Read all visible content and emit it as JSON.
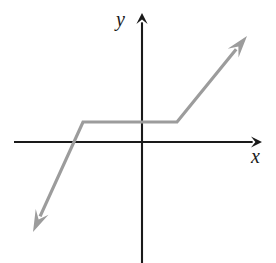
{
  "figure": {
    "type": "math-graph",
    "width": 276,
    "height": 263,
    "background_color": "#ffffff",
    "axis_color": "#1a1a1a",
    "curve_color": "#9c9c9c",
    "labels": {
      "y_axis": "y",
      "x_axis": "x"
    }
  },
  "chart_data": {
    "type": "line",
    "title": "",
    "subtitle": "",
    "xlabel": "x",
    "ylabel": "y",
    "grid": false,
    "legend": "none",
    "annotations": [],
    "axes": {
      "origin_px": [
        142,
        142
      ],
      "x_axis_px": {
        "start": [
          14,
          142
        ],
        "end": [
          262,
          142
        ],
        "arrow_end": "right"
      },
      "y_axis_px": {
        "start": [
          142,
          263
        ],
        "end": [
          142,
          13
        ],
        "arrow_end": "top"
      },
      "xlim": [
        -4.2,
        4.0
      ],
      "ylim": [
        -4.0,
        2.1
      ],
      "tick_labels_x": [],
      "tick_labels_y": []
    },
    "series": [
      {
        "name": "piecewise linear function",
        "description": "Increasing ray from lower left, flat plateau across the origin region, then increasing ray to upper right",
        "arrow_start": true,
        "arrow_end": true,
        "points_px": [
          [
            33,
            232
          ],
          [
            83,
            122
          ],
          [
            177,
            122
          ],
          [
            247,
            36
          ]
        ],
        "points_data": [
          [
            -3.6,
            -2.9
          ],
          [
            -1.9,
            0.6
          ],
          [
            1.1,
            0.6
          ],
          [
            3.4,
            3.4
          ]
        ],
        "segments": [
          {
            "kind": "ray-increasing",
            "from_px": [
              33,
              232
            ],
            "to_px": [
              83,
              122
            ]
          },
          {
            "kind": "horizontal-plateau",
            "from_px": [
              83,
              122
            ],
            "to_px": [
              177,
              122
            ]
          },
          {
            "kind": "ray-increasing",
            "from_px": [
              177,
              122
            ],
            "to_px": [
              247,
              36
            ]
          }
        ]
      }
    ]
  }
}
